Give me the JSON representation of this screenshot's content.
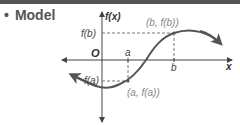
{
  "header": {
    "bullet": "•",
    "title": "Model"
  },
  "graph": {
    "y_axis_label": "f(x)",
    "x_axis_label": "x",
    "origin_label": "O",
    "fb_label": "f(b)",
    "fa_label": "f(a)",
    "a_label": "a",
    "b_label": "b",
    "point_b_label": "(b, f(b))",
    "point_a_label": "(a, f(a))"
  },
  "colors": {
    "topbar": "#555555",
    "curve": "#555555",
    "axes": "#444444",
    "dashed": "#777777"
  }
}
